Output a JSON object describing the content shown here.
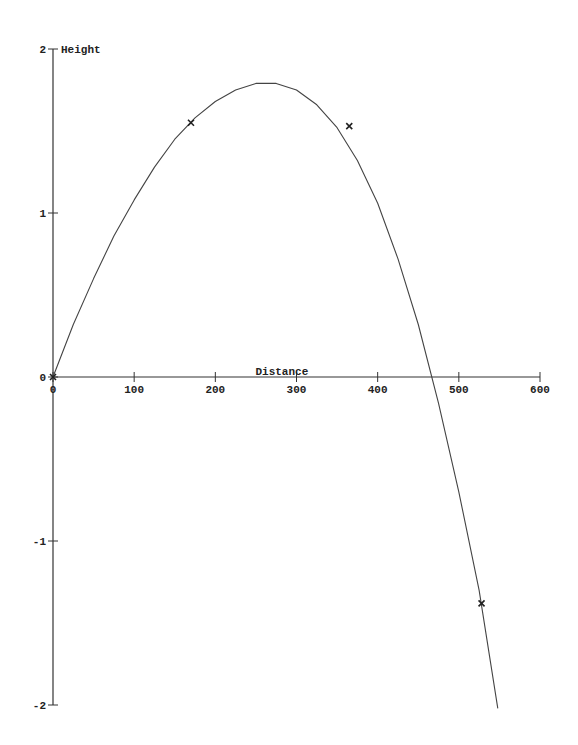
{
  "chart_data": {
    "type": "line",
    "title": "",
    "xlabel": "Distance",
    "ylabel": "Height",
    "xlim": [
      0,
      600
    ],
    "ylim": [
      -2,
      2
    ],
    "x_ticks": [
      "0",
      "100",
      "200",
      "300",
      "400",
      "500",
      "600"
    ],
    "y_ticks": [
      "2",
      "1",
      "0",
      "-1",
      "-2"
    ],
    "grid": false,
    "legend": null,
    "series": [
      {
        "name": "trajectory",
        "style": "line",
        "x": [
          0,
          25,
          50,
          75,
          100,
          125,
          150,
          175,
          200,
          225,
          250,
          275,
          300,
          325,
          350,
          375,
          400,
          425,
          450,
          475,
          500,
          525,
          548
        ],
        "y": [
          0,
          0.32,
          0.6,
          0.86,
          1.08,
          1.28,
          1.45,
          1.58,
          1.68,
          1.75,
          1.79,
          1.79,
          1.75,
          1.66,
          1.52,
          1.32,
          1.06,
          0.72,
          0.32,
          -0.16,
          -0.7,
          -1.3,
          -2.02
        ]
      },
      {
        "name": "observations",
        "style": "markers",
        "marker": "x",
        "x": [
          0,
          170,
          365,
          528
        ],
        "y": [
          0,
          1.55,
          1.53,
          -1.38
        ]
      }
    ]
  }
}
